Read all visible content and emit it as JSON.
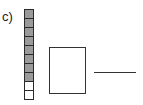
{
  "problem": {
    "label": "c)",
    "ten_frame": {
      "cells": [
        "filled",
        "filled",
        "filled",
        "filled",
        "filled",
        "filled",
        "filled",
        "filled",
        "empty",
        "empty"
      ],
      "filled_count": 8,
      "colors": {
        "filled": "#9a9a9a",
        "empty": "#ffffff",
        "border": "#2a2a2a"
      }
    },
    "answer_box": {
      "value": ""
    },
    "answer_line": {
      "value": ""
    }
  }
}
